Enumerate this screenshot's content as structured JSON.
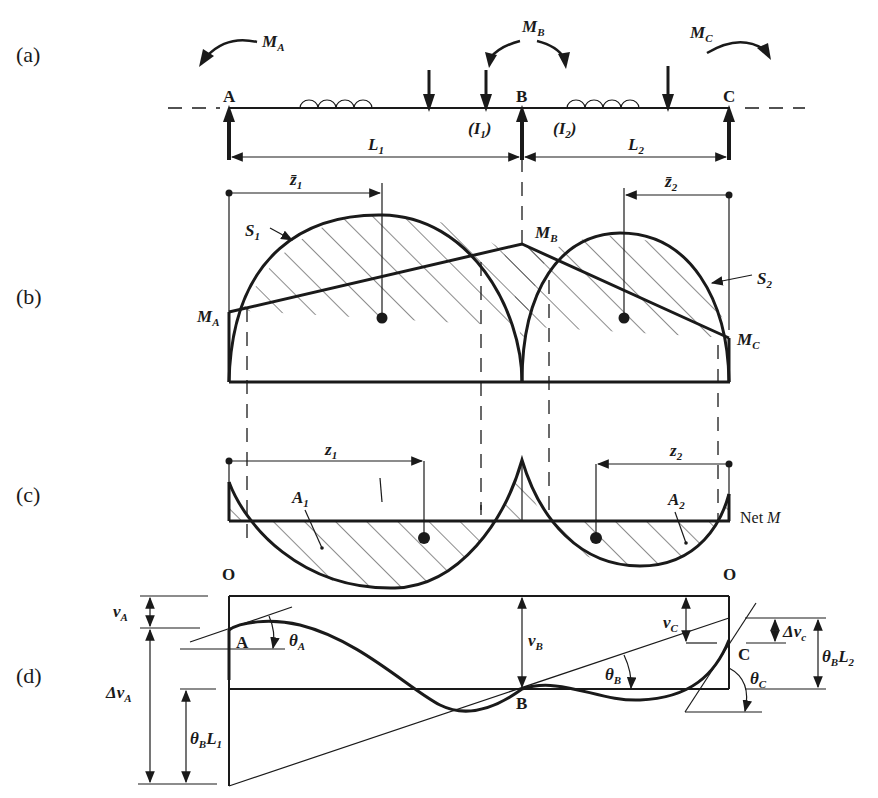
{
  "figure": {
    "panels": [
      {
        "id": "a",
        "label": "(a)"
      },
      {
        "id": "b",
        "label": "(b)"
      },
      {
        "id": "c",
        "label": "(c)"
      },
      {
        "id": "d",
        "label": "(d)"
      }
    ],
    "beam": {
      "supports": [
        "A",
        "B",
        "C"
      ],
      "moments": {
        "MA": "M",
        "MA_sub": "A",
        "MB": "M",
        "MB_sub": "B",
        "MC": "M",
        "MC_sub": "C"
      },
      "inertia": {
        "I1": "(I",
        "I1_sub": "1",
        "I1_close": ")",
        "I2": "(I",
        "I2_sub": "2",
        "I2_close": ")"
      },
      "spans": {
        "L1": "L",
        "L1_sub": "1",
        "L2": "L",
        "L2_sub": "2"
      }
    },
    "moment_diagram": {
      "z1bar": "z̄",
      "z1bar_sub": "1",
      "z2bar": "z̄",
      "z2bar_sub": "2",
      "S1": "S",
      "S1_sub": "1",
      "S2": "S",
      "S2_sub": "2",
      "MA": "M",
      "MA_sub": "A",
      "MB": "M",
      "MB_sub": "B",
      "MC": "M",
      "MC_sub": "C"
    },
    "net_moment": {
      "z1": "z",
      "z1_sub": "1",
      "z2": "z",
      "z2_sub": "2",
      "A1": "A",
      "A1_sub": "1",
      "A2": "A",
      "A2_sub": "2",
      "net_label": "Net ",
      "net_M": "M"
    },
    "deflection": {
      "O_left": "O",
      "O_right": "O",
      "A": "A",
      "B": "B",
      "C": "C",
      "vA": "v",
      "vA_sub": "A",
      "dvA": "Δv",
      "dvA_sub": "A",
      "thetaA": "θ",
      "thetaA_sub": "A",
      "vB": "v",
      "vB_sub": "B",
      "vC": "v",
      "vC_sub": "C",
      "dvC": "Δv",
      "dvC_sub": "c",
      "thetaB": "θ",
      "thetaB_sub": "B",
      "thetaC": "θ",
      "thetaC_sub": "C",
      "thetaBL1": "θ",
      "thetaBL1_sub": "B",
      "thetaBL1_L": "L",
      "thetaBL1_Lsub": "1",
      "thetaBL2": "θ",
      "thetaBL2_sub": "B",
      "thetaBL2_L": "L",
      "thetaBL2_Lsub": "2"
    }
  }
}
